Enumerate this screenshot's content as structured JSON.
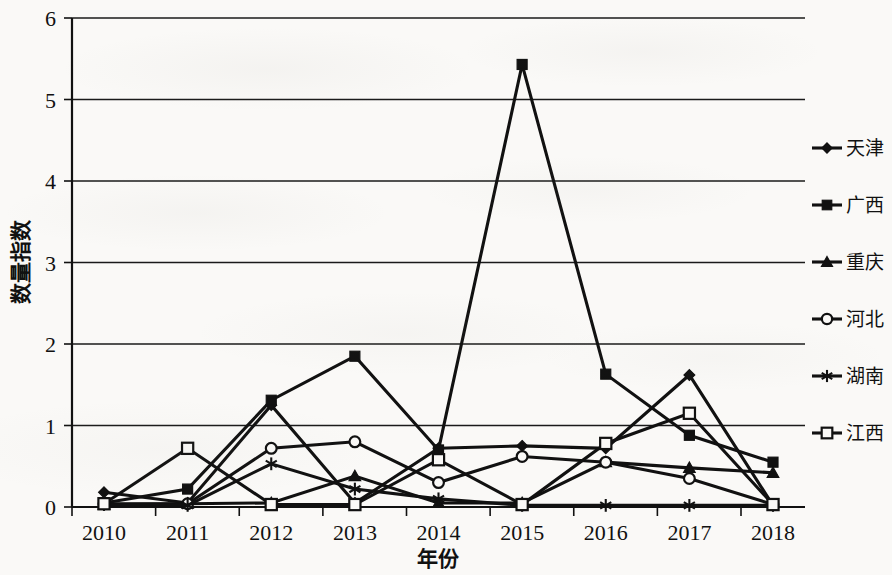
{
  "chart_data": {
    "type": "line",
    "title": "",
    "xlabel": "年份",
    "ylabel": "数量指数",
    "categories": [
      "2010",
      "2011",
      "2012",
      "2013",
      "2014",
      "2015",
      "2016",
      "2017",
      "2018"
    ],
    "x": [
      2010,
      2011,
      2012,
      2013,
      2014,
      2015,
      2016,
      2017,
      2018
    ],
    "ylim": [
      0,
      6
    ],
    "yticks": [
      0,
      1,
      2,
      3,
      4,
      5,
      6
    ],
    "ytick_labels": [
      "0",
      "1",
      "2",
      "3",
      "4",
      "5",
      "6"
    ],
    "grid": true,
    "grid_axis": "y",
    "legend_position": "right",
    "series": [
      {
        "name": "天津",
        "marker": "diamond",
        "values": [
          0.18,
          0.05,
          1.25,
          0.05,
          0.72,
          0.75,
          0.72,
          1.62,
          0.02
        ]
      },
      {
        "name": "广西",
        "marker": "square-filled",
        "values": [
          0.05,
          0.22,
          1.31,
          1.85,
          0.7,
          5.43,
          1.63,
          0.88,
          0.55
        ]
      },
      {
        "name": "重庆",
        "marker": "triangle",
        "values": [
          0.03,
          0.04,
          0.05,
          0.38,
          0.05,
          0.05,
          0.55,
          0.48,
          0.42
        ]
      },
      {
        "name": "河北",
        "marker": "circle-open",
        "values": [
          0.04,
          0.04,
          0.72,
          0.8,
          0.3,
          0.62,
          0.55,
          0.35,
          0.03
        ]
      },
      {
        "name": "湖南",
        "marker": "asterisk",
        "values": [
          0.03,
          0.02,
          0.53,
          0.22,
          0.1,
          0.02,
          0.02,
          0.02,
          0.02
        ]
      },
      {
        "name": "江西",
        "marker": "square-open",
        "values": [
          0.04,
          0.72,
          0.03,
          0.03,
          0.58,
          0.03,
          0.78,
          1.15,
          0.03
        ]
      }
    ]
  },
  "axes": {
    "y_title": "数量指数",
    "x_title": "年份"
  },
  "legend": {
    "entries": [
      {
        "label": "天津",
        "marker": "diamond"
      },
      {
        "label": "广西",
        "marker": "square-filled"
      },
      {
        "label": "重庆",
        "marker": "triangle"
      },
      {
        "label": "河北",
        "marker": "circle-open"
      },
      {
        "label": "湖南",
        "marker": "asterisk"
      },
      {
        "label": "江西",
        "marker": "square-open"
      }
    ]
  },
  "colors": {
    "ink": "#111111",
    "paper": "#faf9f7"
  }
}
